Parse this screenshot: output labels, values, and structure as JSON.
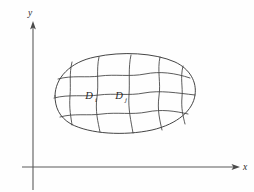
{
  "figure": {
    "background_color": "#fefefe",
    "stroke_color": "#3a3a3a",
    "axis_color": "#5a5a5a",
    "label_color": "#1f1f1f"
  },
  "axes": {
    "x_label": "x",
    "y_label": "y",
    "origin": {
      "x": 33,
      "y": 167
    },
    "x_axis_end": {
      "x": 238,
      "y": 167
    },
    "y_axis_top": {
      "x": 33,
      "y": 23
    },
    "y_axis_bottom": {
      "x": 33,
      "y": 190
    },
    "x_label_pos": {
      "x": 244,
      "y": 170
    },
    "y_label_pos": {
      "x": 30,
      "y": 16
    }
  },
  "region": {
    "name": "D",
    "bounds": {
      "left": 53,
      "top": 55,
      "right": 196,
      "bottom": 134
    },
    "outline_path": "M 55 96 C 55 78, 70 62, 95 57 C 122 51, 155 53, 175 62 C 190 69, 197 82, 195 95 C 193 110, 178 124, 152 130 C 124 136, 90 134, 71 124 C 59 117, 55 107, 55 96 Z"
  },
  "grid": {
    "vertical_curves": [
      "M 72 62 C 69 74, 71 84, 70 96 C 69 109, 71 117, 72 125",
      "M 99 57 C 96 70, 99 84, 97 97 C 95 111, 98 122, 100 132",
      "M 131 55 C 128 68, 130 82, 129 95 C 128 109, 131 121, 133 133",
      "M 160 57 C 157 70, 161 83, 159 96 C 157 110, 160 121, 162 130",
      "M 183 66 C 180 78, 183 87, 182 97 C 181 108, 183 116, 185 124"
    ],
    "horizontal_curves": [
      "M 58 79 C 72 75, 86 78, 100 76 C 115 74, 130 77, 145 74 C 160 71, 175 73, 190 78",
      "M 54 98 C 69 94, 84 97, 99 95 C 114 93, 129 96, 144 93 C 160 90, 177 93, 195 95",
      "M 60 117 C 74 113, 88 116, 102 114 C 117 112, 132 115, 147 112 C 161 109, 175 111, 188 114"
    ]
  },
  "labels": [
    {
      "name": "D_i",
      "base": "D",
      "subscript": "i",
      "x": 89,
      "y": 99
    },
    {
      "name": "D_j",
      "base": "D",
      "subscript": "j",
      "x": 119,
      "y": 99
    }
  ]
}
